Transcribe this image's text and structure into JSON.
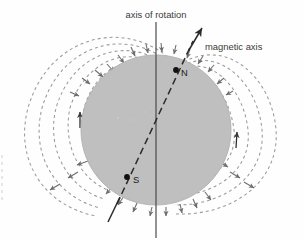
{
  "figure": {
    "background_color": "#fefefe",
    "width": 305,
    "height": 241
  },
  "body": {
    "name": "planet-sphere",
    "fill_color": "#bfbfbf",
    "edge_color": "#b0b0b0",
    "center_x": 156,
    "center_y": 130,
    "radius": 75
  },
  "labels": {
    "axis_of_rotation": "axis of rotation",
    "magnetic_axis": "magnetic axis",
    "north_pole": "N",
    "south_pole": "S"
  },
  "axes": {
    "rotation": {
      "name": "axis-of-rotation-line",
      "color": "#4a4a4a",
      "x": 156,
      "y_top": 22,
      "y_bottom": 238
    },
    "magnetic": {
      "name": "magnetic-axis-arrow",
      "color": "#2b2b2b",
      "tilt_degrees": 25,
      "arrow_tip_x": 202,
      "arrow_tip_y": 28,
      "tail_x": 108,
      "tail_y": 222
    }
  },
  "poles": {
    "north": {
      "x": 176,
      "y": 70,
      "label_x": 181,
      "label_y": 75
    },
    "south": {
      "x": 127,
      "y": 177,
      "label_x": 133,
      "label_y": 182
    }
  },
  "field": {
    "name": "dipole-field-lines",
    "line_color": "#9a9a9a",
    "dash_pattern": "3 3",
    "arrow_color": "#6e6e6e",
    "loop_count": 7,
    "description": "Dashed dipole magnetic field loops emerging near the magnetic north pole and returning near the magnetic south pole, with small arrowheads indicating field direction."
  }
}
